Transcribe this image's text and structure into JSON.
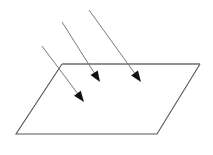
{
  "figure": {
    "canvas": {
      "width": 213,
      "height": 155,
      "background": "#ffffff"
    },
    "plane": {
      "name": "plane-surface",
      "shape": "parallelogram",
      "stroke": "#555555",
      "top_edge_stroke": "#6e6e6e",
      "stroke_width": 1.1,
      "fill": "none",
      "vertices": [
        {
          "label": "top-left",
          "x": 62,
          "y": 64
        },
        {
          "label": "top-right",
          "x": 200,
          "y": 64
        },
        {
          "label": "bottom-right",
          "x": 157,
          "y": 134
        },
        {
          "label": "bottom-left",
          "x": 16,
          "y": 134
        }
      ]
    },
    "rays": {
      "count": 3,
      "shaft_stroke": "#7a7a7a",
      "shaft_width": 1.0,
      "head_fill": "#111111",
      "direction": {
        "dx": 52,
        "dy": 60
      },
      "items": [
        {
          "name": "ray-left",
          "start": {
            "x": 42,
            "y": 46
          },
          "end": {
            "x": 84,
            "y": 102
          },
          "head_length": 11,
          "head_width": 4.2
        },
        {
          "name": "ray-middle",
          "start": {
            "x": 62,
            "y": 22
          },
          "end": {
            "x": 100,
            "y": 82
          },
          "head_length": 11,
          "head_width": 4.2
        },
        {
          "name": "ray-right",
          "start": {
            "x": 89,
            "y": 10
          },
          "end": {
            "x": 141,
            "y": 82
          },
          "head_length": 11,
          "head_width": 4.2
        }
      ]
    }
  }
}
